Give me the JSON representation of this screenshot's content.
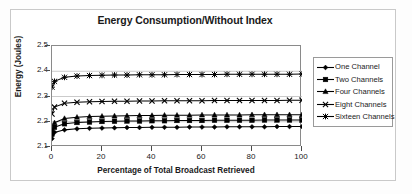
{
  "chart_data": {
    "type": "line",
    "title": "Energy Consumption/Without Index",
    "xlabel": "Percentage of Total Broadcast Retrieved",
    "ylabel": "Energy (Joules)",
    "xlim": [
      0,
      100
    ],
    "ylim": [
      2.1,
      2.5
    ],
    "xticks": [
      0,
      20,
      40,
      60,
      80,
      100
    ],
    "yticks": [
      2.1,
      2.2,
      2.3,
      2.4,
      2.5
    ],
    "xtick_labels": [
      "0",
      "20",
      "40",
      "60",
      "80",
      "100"
    ],
    "ytick_labels": [
      "2.1",
      "2.2",
      "2.3",
      "2.4",
      "2.5"
    ],
    "grid": "horizontal",
    "legend_position": "right",
    "x": [
      0,
      1,
      5,
      10,
      15,
      20,
      25,
      30,
      35,
      40,
      45,
      50,
      55,
      60,
      65,
      70,
      75,
      80,
      85,
      90,
      95,
      100
    ],
    "series": [
      {
        "name": "One Channel",
        "marker": "diamond",
        "color": "#000000",
        "values": [
          2.133,
          2.158,
          2.168,
          2.172,
          2.174,
          2.175,
          2.176,
          2.177,
          2.177,
          2.178,
          2.178,
          2.178,
          2.179,
          2.179,
          2.179,
          2.18,
          2.18,
          2.18,
          2.18,
          2.181,
          2.181,
          2.181
        ]
      },
      {
        "name": "Two Channels",
        "marker": "square",
        "color": "#000000",
        "values": [
          2.151,
          2.178,
          2.192,
          2.197,
          2.199,
          2.201,
          2.202,
          2.203,
          2.203,
          2.204,
          2.204,
          2.205,
          2.205,
          2.205,
          2.206,
          2.206,
          2.206,
          2.206,
          2.207,
          2.207,
          2.207,
          2.207
        ]
      },
      {
        "name": "Four Channels",
        "marker": "triangle",
        "color": "#000000",
        "values": [
          2.163,
          2.196,
          2.213,
          2.218,
          2.221,
          2.222,
          2.223,
          2.224,
          2.225,
          2.225,
          2.226,
          2.226,
          2.226,
          2.227,
          2.227,
          2.227,
          2.227,
          2.228,
          2.228,
          2.228,
          2.228,
          2.228
        ]
      },
      {
        "name": "Eight Channels",
        "marker": "x",
        "color": "#000000",
        "values": [
          2.231,
          2.258,
          2.273,
          2.277,
          2.279,
          2.28,
          2.281,
          2.281,
          2.282,
          2.282,
          2.283,
          2.283,
          2.283,
          2.283,
          2.284,
          2.284,
          2.284,
          2.284,
          2.284,
          2.284,
          2.285,
          2.285
        ]
      },
      {
        "name": "Sixteen Channels",
        "marker": "asterisk",
        "color": "#000000",
        "values": [
          2.337,
          2.36,
          2.376,
          2.381,
          2.383,
          2.384,
          2.385,
          2.385,
          2.386,
          2.386,
          2.386,
          2.387,
          2.387,
          2.387,
          2.387,
          2.388,
          2.388,
          2.388,
          2.388,
          2.388,
          2.388,
          2.389
        ]
      }
    ]
  },
  "legend": {
    "items": [
      {
        "label": "One Channel"
      },
      {
        "label": "Two Channels"
      },
      {
        "label": "Four Channels"
      },
      {
        "label": "Eight Channels"
      },
      {
        "label": "Sixteen Channels"
      }
    ]
  }
}
